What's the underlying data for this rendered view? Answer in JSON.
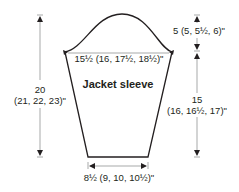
{
  "diagram": {
    "title": "Jacket sleeve",
    "colors": {
      "outline": "#231f20",
      "dimension_line": "#6d6e71",
      "text": "#231f20",
      "background": "#ffffff"
    },
    "measurements": {
      "upper_width": "15½ (16, 17½, 18½)\"",
      "cuff_width": "8½ (9, 10, 10½)\"",
      "total_length_line1": "20",
      "total_length_line2": "(21, 22, 23)\"",
      "cap_height": "5 (5, 5½, 6)\"",
      "underarm_length_line1": "15",
      "underarm_length_line2": "(16, 16½, 17)\""
    }
  }
}
